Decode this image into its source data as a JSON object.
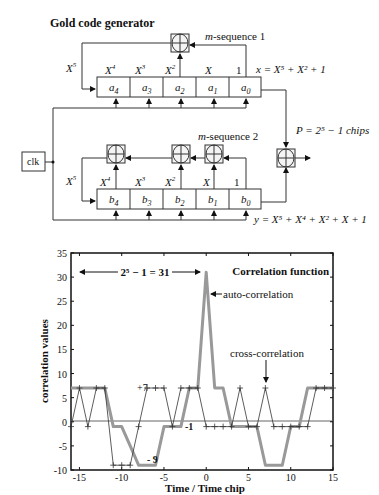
{
  "diagram": {
    "title": "Gold code generator",
    "seq1_label_prefix": "m",
    "seq1_label_suffix": "-sequence 1",
    "seq2_label_prefix": "m",
    "seq2_label_suffix": "-sequence 2",
    "clk_label": "clk",
    "reg_a": [
      "a4",
      "a3",
      "a2",
      "a1",
      "a0"
    ],
    "reg_b": [
      "b4",
      "b3",
      "b2",
      "b1",
      "b0"
    ],
    "tap_labels": [
      "X5",
      "X4",
      "X3",
      "X2",
      "X",
      "1"
    ],
    "poly_x": "x = X⁵ + X² + 1",
    "poly_y": "y = X⁵ + X⁴ + X² + X + 1",
    "period_label": "P = 2⁵ − 1 chips"
  },
  "chart_data": {
    "type": "line",
    "title": "Correlation function",
    "xlabel": "Time / Time chip",
    "ylabel": "correlation values",
    "xlim": [
      -16,
      15
    ],
    "ylim": [
      -10,
      35
    ],
    "xticks": [
      -15,
      -10,
      -5,
      0,
      5,
      10,
      15
    ],
    "yticks": [
      -10,
      -5,
      0,
      5,
      10,
      15,
      20,
      25,
      30,
      35
    ],
    "grid": false,
    "x": [
      -16,
      -15,
      -14,
      -13,
      -12,
      -11,
      -10,
      -9,
      -8,
      -7,
      -6,
      -5,
      -4,
      -3,
      -2,
      -1,
      0,
      1,
      2,
      3,
      4,
      5,
      6,
      7,
      8,
      9,
      10,
      11,
      12,
      13,
      14,
      15
    ],
    "series": [
      {
        "name": "auto-correlation",
        "style": "thick gray",
        "values": [
          7,
          7,
          7,
          7,
          7,
          -1,
          -1,
          -5,
          -9,
          -9,
          -9,
          -1,
          -1,
          -1,
          7,
          7,
          31,
          7,
          7,
          -1,
          -1,
          -1,
          -1,
          -9,
          -9,
          -9,
          -1,
          -1,
          7,
          7,
          7,
          7
        ]
      },
      {
        "name": "cross-correlation",
        "style": "thin with + markers",
        "values": [
          -1,
          7,
          -1,
          7,
          7,
          -9,
          -9,
          -9,
          -1,
          7,
          7,
          7,
          -1,
          7,
          7,
          7,
          -1,
          -1,
          -1,
          -1,
          7,
          -1,
          -1,
          7,
          -1,
          -1,
          -1,
          -1,
          -1,
          7,
          7,
          7
        ]
      }
    ],
    "annotations": [
      {
        "text": "2⁵ − 1 = 31",
        "type": "double-arrow",
        "y": 31
      },
      {
        "text": "auto-correlation",
        "points_to": [
          0,
          27
        ]
      },
      {
        "text": "cross-correlation",
        "points_to": [
          7,
          7
        ]
      },
      {
        "text": "+7",
        "at": [
          -7,
          7
        ]
      },
      {
        "text": "-1",
        "at": [
          -3,
          -1
        ]
      },
      {
        "text": "- 9",
        "at": [
          -6,
          -9
        ]
      }
    ]
  }
}
